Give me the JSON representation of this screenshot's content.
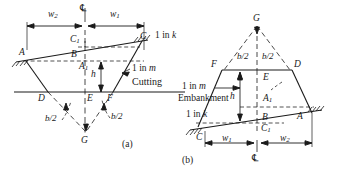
{
  "figure": {
    "caption_a": "(a)",
    "caption_b": "(b)",
    "centerline_symbol": "℄"
  },
  "diagram_a": {
    "title": "Cutting",
    "slope_top": "1 in k",
    "slope_side": "1 in m",
    "points": {
      "A": "A",
      "B": "B",
      "C": "C",
      "C1_letter": "C",
      "C1_sub": "1",
      "A1_letter": "A",
      "A1_sub": "1",
      "D": "D",
      "E": "E",
      "F": "F",
      "G": "G"
    },
    "dims": {
      "w1_letter": "w",
      "w1_sub": "1",
      "w2_letter": "w",
      "w2_sub": "2",
      "height": "h",
      "half_base_left": "b/2",
      "half_base_right": "b/2"
    }
  },
  "diagram_b": {
    "title": "Embankment",
    "slope_top": "1 in m",
    "slope_side": "1 in k",
    "points": {
      "A": "A",
      "B": "B",
      "C": "C",
      "C1_letter": "C",
      "C1_sub": "1",
      "A1_letter": "A",
      "A1_sub": "1",
      "D": "D",
      "E": "E",
      "F": "F",
      "G": "G"
    },
    "dims": {
      "w1_letter": "w",
      "w1_sub": "1",
      "w2_letter": "w",
      "w2_sub": "2",
      "height": "h",
      "half_base_left": "b/2",
      "half_base_right": "b/2"
    }
  },
  "colors": {
    "ink": "#1a1a1a",
    "background": "#ffffff"
  }
}
